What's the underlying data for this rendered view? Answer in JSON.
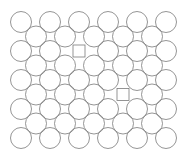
{
  "diagram": {
    "title": "",
    "stroke_color": "#7a7a7a",
    "background_color": "#ffffff",
    "rows": [
      {
        "items": [
          "circle",
          "circle",
          "circle",
          "circle",
          "circle",
          "circle"
        ]
      },
      {
        "items": [
          "circle",
          "circle",
          "circle",
          "circle",
          "circle"
        ]
      },
      {
        "items": [
          "circle",
          "circle",
          "square",
          "circle",
          "circle",
          "circle"
        ]
      },
      {
        "items": [
          "circle",
          "circle",
          "circle",
          "circle",
          "circle"
        ]
      },
      {
        "items": [
          "circle",
          "circle",
          "circle",
          "circle",
          "circle",
          "circle"
        ]
      },
      {
        "items": [
          "circle",
          "circle",
          "circle",
          "square",
          "circle"
        ]
      },
      {
        "items": [
          "circle",
          "circle",
          "circle",
          "circle",
          "circle",
          "circle"
        ]
      },
      {
        "items": [
          "circle",
          "circle",
          "circle",
          "circle",
          "circle"
        ]
      },
      {
        "items": [
          "circle",
          "circle",
          "circle",
          "circle",
          "circle",
          "circle"
        ]
      }
    ]
  }
}
